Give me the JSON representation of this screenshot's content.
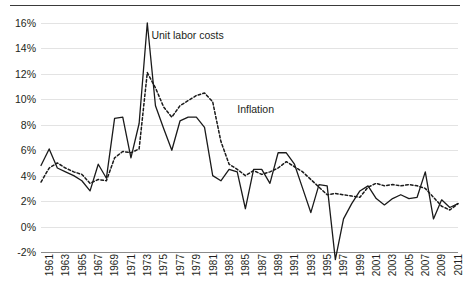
{
  "chart_data": {
    "type": "line",
    "title": "",
    "subtitle": "",
    "xlabel": "",
    "ylabel": "",
    "ylim": [
      -2,
      16
    ],
    "xlim": [
      1961,
      2012
    ],
    "grid": true,
    "legend_position": "inline-annotation",
    "ytick_labels": [
      "16%",
      "14%",
      "12%",
      "10%",
      "8%",
      "6%",
      "4%",
      "2%",
      "0%",
      "-2%"
    ],
    "ytick_values": [
      16,
      14,
      12,
      10,
      8,
      6,
      4,
      2,
      0,
      -2
    ],
    "xtick_labels": [
      "1961",
      "1963",
      "1965",
      "1967",
      "1969",
      "1971",
      "1973",
      "1975",
      "1977",
      "1979",
      "1981",
      "1983",
      "1985",
      "1987",
      "1989",
      "1991",
      "1993",
      "1995",
      "1997",
      "1999",
      "2001",
      "2003",
      "2005",
      "2007",
      "2009",
      "2011"
    ],
    "xtick_values": [
      1961,
      1963,
      1965,
      1967,
      1969,
      1971,
      1973,
      1975,
      1977,
      1979,
      1981,
      1983,
      1985,
      1987,
      1989,
      1991,
      1993,
      1995,
      1997,
      1999,
      2001,
      2003,
      2005,
      2007,
      2009,
      2011
    ],
    "x": [
      1961,
      1962,
      1963,
      1964,
      1965,
      1966,
      1967,
      1968,
      1969,
      1970,
      1971,
      1972,
      1973,
      1974,
      1975,
      1976,
      1977,
      1978,
      1979,
      1980,
      1981,
      1982,
      1983,
      1984,
      1985,
      1986,
      1987,
      1988,
      1989,
      1990,
      1991,
      1992,
      1993,
      1994,
      1995,
      1996,
      1997,
      1998,
      1999,
      2000,
      2001,
      2002,
      2003,
      2004,
      2005,
      2006,
      2007,
      2008,
      2009,
      2010,
      2011,
      2012
    ],
    "series": [
      {
        "name": "Unit labor costs",
        "style": "solid",
        "color": "#1a1a1a",
        "label_x": 1974.5,
        "label_y": 15.0,
        "values": [
          4.8,
          6.1,
          4.6,
          4.3,
          4.0,
          3.6,
          2.8,
          4.9,
          3.8,
          8.5,
          8.6,
          5.4,
          8.1,
          16.0,
          9.5,
          7.7,
          6.0,
          8.3,
          8.6,
          8.6,
          7.8,
          4.0,
          3.6,
          4.5,
          4.3,
          1.4,
          4.5,
          4.5,
          3.4,
          5.8,
          5.8,
          4.9,
          3.0,
          1.1,
          3.3,
          3.2,
          -2.6,
          0.6,
          1.8,
          2.8,
          3.2,
          2.2,
          1.7,
          2.2,
          2.5,
          2.2,
          2.3,
          4.3,
          0.6,
          2.1,
          1.5,
          1.8
        ]
      },
      {
        "name": "Inflation",
        "style": "dashed",
        "color": "#1a1a1a",
        "label_x": 1985.0,
        "label_y": 9.2,
        "values": [
          3.5,
          4.6,
          5.0,
          4.6,
          4.3,
          4.1,
          3.4,
          3.7,
          3.6,
          5.4,
          5.9,
          5.8,
          6.1,
          12.1,
          10.9,
          9.4,
          8.6,
          9.5,
          9.9,
          10.3,
          10.5,
          9.8,
          6.7,
          4.9,
          4.5,
          4.0,
          4.4,
          4.1,
          4.3,
          4.6,
          5.1,
          4.7,
          4.3,
          3.7,
          3.1,
          2.5,
          2.6,
          2.5,
          2.4,
          2.3,
          3.1,
          3.4,
          3.2,
          3.3,
          3.2,
          3.3,
          3.2,
          3.0,
          2.3,
          1.6,
          1.3,
          1.8
        ]
      }
    ]
  },
  "annotations": {
    "series_labels": [
      "Unit labor costs",
      "Inflation"
    ]
  }
}
